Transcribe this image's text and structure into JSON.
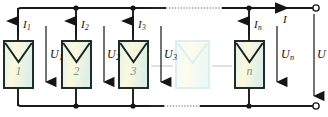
{
  "diagram": {
    "type": "electrical-schematic",
    "colors": {
      "wire": "#1a1a1a",
      "device_outline": "#1a2a22",
      "device_fill_center": "#fdfbe0",
      "device_fill_edge": "#dff0ea",
      "device_number": "#7d9a86",
      "ghost_outline": "#d8ece6",
      "ghost_fill_center": "#fdfbe6",
      "ghost_fill_edge": "#e8f5f1",
      "background": "#ffffff"
    },
    "devices": [
      {
        "id": "d1",
        "label": "1",
        "ghost": false
      },
      {
        "id": "d2",
        "label": "2",
        "ghost": false
      },
      {
        "id": "d3",
        "label": "3",
        "ghost": false
      },
      {
        "id": "dghost",
        "label": "",
        "ghost": true
      },
      {
        "id": "dn",
        "label": "n",
        "ghost": false
      }
    ],
    "current_labels": [
      {
        "id": "i1",
        "symbol": "I",
        "sub": "1"
      },
      {
        "id": "i2",
        "symbol": "I",
        "sub": "2"
      },
      {
        "id": "i3",
        "symbol": "I",
        "sub": "3"
      },
      {
        "id": "in",
        "symbol": "I",
        "sub": "n"
      },
      {
        "id": "i_total",
        "symbol": "I",
        "sub": ""
      }
    ],
    "voltage_labels": [
      {
        "id": "u1",
        "symbol": "U",
        "sub": "1"
      },
      {
        "id": "u2",
        "symbol": "U",
        "sub": "2"
      },
      {
        "id": "u3",
        "symbol": "U",
        "sub": "3"
      },
      {
        "id": "un",
        "symbol": "U",
        "sub": "n"
      },
      {
        "id": "u_total",
        "symbol": "U",
        "sub": ""
      }
    ],
    "terminals": [
      {
        "id": "terminal-top-right",
        "style": "open-circle"
      },
      {
        "id": "terminal-bottom-right",
        "style": "open-circle"
      }
    ],
    "junction_dots": 6,
    "ellipsis_segments": [
      "top-rail-dotted",
      "bottom-rail-dotted",
      "device-link-dotted"
    ]
  }
}
